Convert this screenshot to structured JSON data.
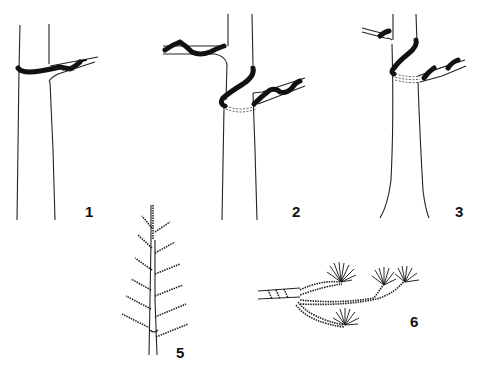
{
  "figure": {
    "panels": [
      {
        "id": "panel-1",
        "label": "1",
        "subject": "trunk with single wire wrap around branch junction"
      },
      {
        "id": "panel-2",
        "label": "2",
        "subject": "trunk with wire anchored across trunk to two opposing branches"
      },
      {
        "id": "panel-3",
        "label": "3",
        "subject": "trunk with diagonal wire wrap connecting two branches"
      },
      {
        "id": "panel-5",
        "label": "5",
        "subject": "branch with side shoots arranged in herringbone pattern"
      },
      {
        "id": "panel-6",
        "label": "6",
        "subject": "wired branch with needle tufts at tips"
      }
    ]
  },
  "colors": {
    "background": "#ffffff",
    "ink": "#111111"
  }
}
